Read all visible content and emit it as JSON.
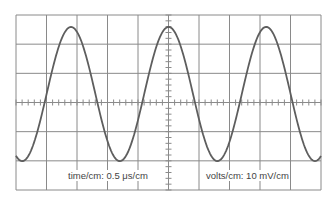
{
  "diagram": {
    "type": "oscilloscope-trace",
    "grid": {
      "x_divisions": 10,
      "y_divisions": 6,
      "minor_ticks_per_division": 5,
      "line_color": "#8a8a8a"
    },
    "trace": {
      "shape": "sine",
      "color": "#5e5e5e",
      "period_divisions": 3.2,
      "peak_to_peak_divisions": 4.6,
      "cycles_visible": 3.1
    },
    "labels": {
      "time": "time/cm: 0.5  μs/cm",
      "volts": "volts/cm: 10 mV/cm"
    }
  },
  "chart_data": {
    "type": "line",
    "title": "",
    "xlabel": "time/cm: 0.5 μs/cm",
    "ylabel": "volts/cm: 10 mV/cm",
    "grid": true,
    "x_divisions": 10,
    "y_divisions": 6,
    "series": [
      {
        "name": "sine trace",
        "amplitude_divisions": 2.3,
        "period_divisions": 3.2,
        "period_us": 1.6,
        "amplitude_mV": 23,
        "peak_x_divisions": [
          1.8,
          5.0,
          8.2
        ],
        "trough_x_divisions": [
          0.2,
          3.4,
          6.6,
          9.8
        ]
      }
    ]
  }
}
